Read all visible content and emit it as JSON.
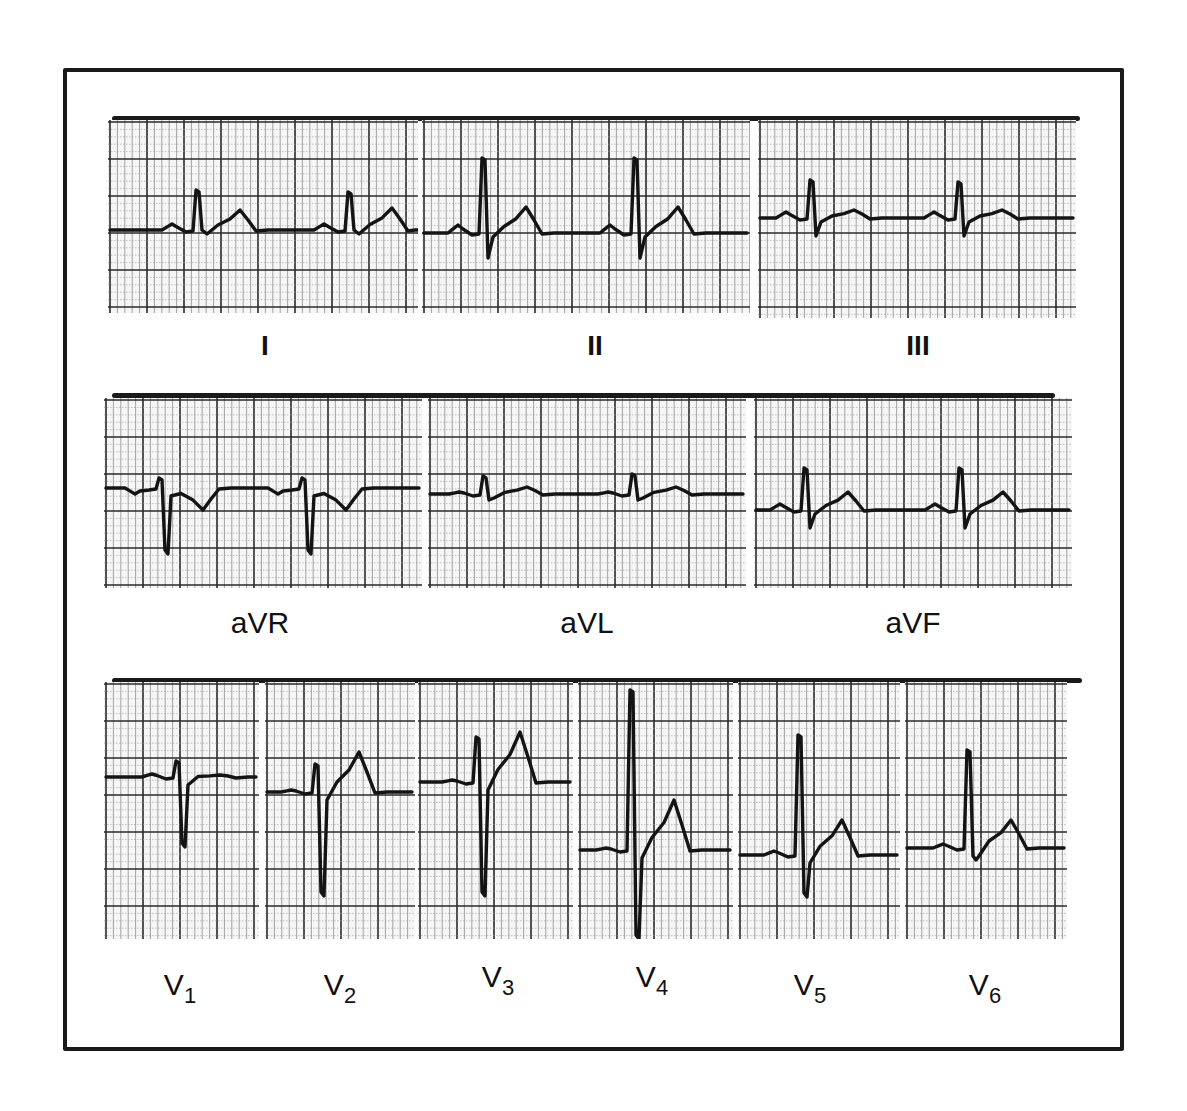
{
  "figure": {
    "trace_color": "#141414",
    "grid_minor_color": "#9a9a9a",
    "grid_major_color": "#2a2a2a",
    "paper_color": "#f6f6f6"
  },
  "rows": [
    {
      "bar": {
        "x": 112,
        "y": 116,
        "w": 968
      },
      "leads": [
        {
          "id": "I",
          "label": "I",
          "sub": "",
          "x": 108,
          "y": 120,
          "w": 310,
          "h": 193,
          "labelX": 265,
          "labelY": 330,
          "baseline": 110,
          "beats": [
            {
              "x": 88,
              "p": 6,
              "q": 0,
              "r": 40,
              "s": 0,
              "t": 20
            },
            {
              "x": 240,
              "p": 6,
              "q": 0,
              "r": 38,
              "s": 0,
              "t": 22
            }
          ]
        },
        {
          "id": "II",
          "label": "II",
          "sub": "",
          "x": 422,
          "y": 120,
          "w": 328,
          "h": 193,
          "labelX": 595,
          "labelY": 330,
          "baseline": 113,
          "beats": [
            {
              "x": 60,
              "p": 8,
              "q": 0,
              "r": 75,
              "s": 25,
              "t": 26
            },
            {
              "x": 212,
              "p": 8,
              "q": 0,
              "r": 75,
              "s": 25,
              "t": 26
            }
          ]
        },
        {
          "id": "III",
          "label": "III",
          "sub": "",
          "x": 758,
          "y": 120,
          "w": 318,
          "h": 198,
          "labelX": 918,
          "labelY": 330,
          "baseline": 98,
          "beats": [
            {
              "x": 52,
              "p": 6,
              "q": 0,
              "r": 38,
              "s": 18,
              "t": 8
            },
            {
              "x": 200,
              "p": 6,
              "q": 0,
              "r": 36,
              "s": 18,
              "t": 8
            }
          ]
        }
      ]
    },
    {
      "bar": {
        "x": 112,
        "y": 393,
        "w": 943
      },
      "leads": [
        {
          "id": "aVR",
          "label": "aVR",
          "sub": "",
          "x": 104,
          "y": 398,
          "w": 318,
          "h": 190,
          "labelX": 260,
          "labelY": 606,
          "baseline": 90,
          "beats": [
            {
              "x": 55,
              "p": -6,
              "q": 0,
              "r": 10,
              "s": -62,
              "t": -22
            },
            {
              "x": 198,
              "p": -6,
              "q": 0,
              "r": 10,
              "s": -62,
              "t": -22
            }
          ]
        },
        {
          "id": "aVL",
          "label": "aVL",
          "sub": "",
          "x": 428,
          "y": 398,
          "w": 318,
          "h": 190,
          "labelX": 587,
          "labelY": 606,
          "baseline": 96,
          "beats": [
            {
              "x": 55,
              "p": 2,
              "q": 0,
              "r": 18,
              "s": 6,
              "t": 7
            },
            {
              "x": 204,
              "p": 2,
              "q": 0,
              "r": 20,
              "s": 6,
              "t": 7
            }
          ]
        },
        {
          "id": "aVF",
          "label": "aVF",
          "sub": "",
          "x": 754,
          "y": 398,
          "w": 318,
          "h": 190,
          "labelX": 913,
          "labelY": 606,
          "baseline": 112,
          "beats": [
            {
              "x": 50,
              "p": 6,
              "q": 0,
              "r": 42,
              "s": 18,
              "t": 18
            },
            {
              "x": 205,
              "p": 6,
              "q": 0,
              "r": 42,
              "s": 18,
              "t": 18
            }
          ]
        }
      ]
    },
    {
      "bar": {
        "x": 112,
        "y": 678,
        "w": 970
      },
      "leads": [
        {
          "id": "V1",
          "label": "V",
          "sub": "1",
          "x": 104,
          "y": 682,
          "w": 155,
          "h": 257,
          "labelX": 180,
          "labelY": 968,
          "baseline": 95,
          "beats": [
            {
              "x": 72,
              "p": 3,
              "q": 0,
              "r": 16,
              "s": -66,
              "t": 2
            }
          ]
        },
        {
          "id": "V2",
          "label": "V",
          "sub": "2",
          "x": 265,
          "y": 682,
          "w": 150,
          "h": 257,
          "labelX": 340,
          "labelY": 968,
          "baseline": 110,
          "beats": [
            {
              "x": 50,
              "p": 2,
              "q": 0,
              "r": 28,
              "s": -100,
              "t": 40
            }
          ]
        },
        {
          "id": "V3",
          "label": "V",
          "sub": "3",
          "x": 418,
          "y": 682,
          "w": 155,
          "h": 257,
          "labelX": 498,
          "labelY": 960,
          "baseline": 100,
          "beats": [
            {
              "x": 58,
              "p": 2,
              "q": 0,
              "r": 45,
              "s": -110,
              "t": 50
            }
          ]
        },
        {
          "id": "V4",
          "label": "V",
          "sub": "4",
          "x": 578,
          "y": 682,
          "w": 155,
          "h": 257,
          "labelX": 652,
          "labelY": 960,
          "baseline": 168,
          "beats": [
            {
              "x": 52,
              "p": 2,
              "q": 0,
              "r": 160,
              "s": -85,
              "t": 50
            }
          ]
        },
        {
          "id": "V5",
          "label": "V",
          "sub": "5",
          "x": 738,
          "y": 682,
          "w": 162,
          "h": 257,
          "labelX": 810,
          "labelY": 968,
          "baseline": 173,
          "beats": [
            {
              "x": 60,
              "p": 4,
              "q": 0,
              "r": 120,
              "s": -38,
              "t": 35
            }
          ]
        },
        {
          "id": "V6",
          "label": "V",
          "sub": "6",
          "x": 905,
          "y": 682,
          "w": 162,
          "h": 257,
          "labelX": 985,
          "labelY": 968,
          "baseline": 166,
          "beats": [
            {
              "x": 62,
              "p": 4,
              "q": 0,
              "r": 98,
              "s": -8,
              "t": 28
            }
          ]
        }
      ]
    }
  ]
}
